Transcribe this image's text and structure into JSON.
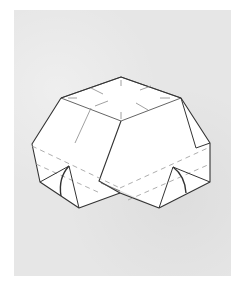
{
  "figure": {
    "colors": {
      "background": "#ffffff",
      "paper": "#e6e6e6",
      "model_fill": "#ffffff",
      "line": "#3a3a3a",
      "crease": "#8a8a8a",
      "dashed": "#9a9a9a"
    }
  }
}
